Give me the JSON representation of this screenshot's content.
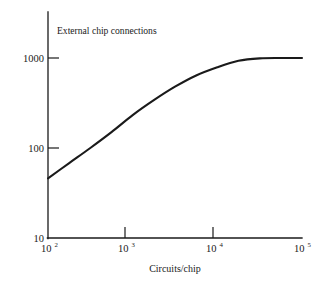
{
  "chart_data": {
    "type": "line",
    "title": "External chip connections",
    "xlabel": "Circuits/chip",
    "ylabel": "",
    "xscale": "log",
    "yscale": "log",
    "xlim": [
      100,
      100000
    ],
    "ylim": [
      10,
      1000
    ],
    "grid": false,
    "legend": null,
    "xticklabels": [
      "10²",
      "10³",
      "10⁴",
      "10⁵"
    ],
    "xtickvalues": [
      100,
      1000,
      10000,
      100000
    ],
    "yticklabels": [
      "10",
      "100",
      "1000"
    ],
    "ytickvalues": [
      10,
      100,
      1000
    ],
    "series": [
      {
        "name": "External chip connections",
        "x": [
          100,
          178,
          316,
          562,
          1000,
          1778,
          3162,
          5623,
          10000,
          17783,
          31623,
          56234,
          100000
        ],
        "y": [
          46,
          68,
          100,
          150,
          232,
          340,
          480,
          640,
          790,
          930,
          990,
          1000,
          1000
        ]
      }
    ],
    "annotations": []
  },
  "axes": {
    "title_in_plot": "External chip connections",
    "x_axis": {
      "label": "Circuits/chip",
      "ticks": [
        {
          "mantissa": "10",
          "exponent": "2"
        },
        {
          "mantissa": "10",
          "exponent": "3"
        },
        {
          "mantissa": "10",
          "exponent": "4"
        },
        {
          "mantissa": "10",
          "exponent": "5"
        }
      ]
    },
    "y_axis": {
      "label": "",
      "ticks": [
        {
          "value": "1000"
        },
        {
          "value": "100"
        },
        {
          "value": "10"
        }
      ]
    }
  },
  "style": {
    "ink_color": "#1a1a1a",
    "background_color": "#ffffff"
  }
}
